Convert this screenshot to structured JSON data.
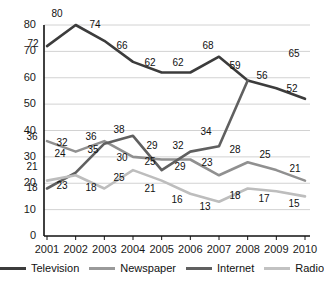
{
  "chart_data": {
    "type": "line",
    "title": "",
    "xlabel": "",
    "ylabel": "",
    "categories": [
      "2001",
      "2002",
      "2003",
      "2004",
      "2005",
      "2006",
      "2007",
      "2008",
      "2009",
      "2010"
    ],
    "ylim": [
      0,
      80
    ],
    "yticks": [
      0,
      10,
      20,
      30,
      40,
      50,
      60,
      70,
      80
    ],
    "grid": true,
    "legend_position": "bottom",
    "series": [
      {
        "name": "Television",
        "color": "#3c3c3c",
        "values": [
          72,
          80,
          74,
          66,
          62,
          62,
          68,
          59,
          56,
          52
        ],
        "labels": [
          "72",
          "80",
          "74",
          "66",
          "62",
          "62",
          "68",
          "59",
          "56",
          "52"
        ]
      },
      {
        "name": "Newspaper",
        "color": "#909090",
        "values": [
          36,
          32,
          36,
          30,
          29,
          29,
          23,
          28,
          25,
          21
        ],
        "labels": [
          "36",
          "32",
          "36",
          "30",
          "29",
          "29",
          "23",
          "28",
          "25",
          "21"
        ]
      },
      {
        "name": "Internet",
        "color": "#606060",
        "values": [
          18,
          24,
          35,
          38,
          25,
          32,
          34,
          59,
          null,
          65
        ],
        "labels": [
          "18",
          "24",
          "35",
          "38",
          "25",
          "32",
          "34",
          "",
          "",
          ""
        ]
      },
      {
        "name": "Radio",
        "color": "#bdbdbd",
        "values": [
          21,
          23,
          18,
          25,
          21,
          16,
          13,
          18,
          17,
          15
        ],
        "labels": [
          "21",
          "23",
          "18",
          "25",
          "21",
          "16",
          "13",
          "18",
          "17",
          "15"
        ]
      }
    ]
  },
  "axis": {
    "y_tick_labels": [
      "80",
      "70",
      "60",
      "50",
      "40",
      "30",
      "20",
      "10",
      "0"
    ],
    "x_tick_labels": [
      "2001",
      "2002",
      "2003",
      "2004",
      "2005",
      "2006",
      "2007",
      "2008",
      "2009",
      "2010"
    ]
  },
  "legend": {
    "items": [
      {
        "label": "Television",
        "color": "#3c3c3c"
      },
      {
        "label": "Newspaper",
        "color": "#9a9a9a"
      },
      {
        "label": "Internet",
        "color": "#606060"
      },
      {
        "label": "Radio",
        "color": "#c2c2c2"
      }
    ]
  },
  "point_labels": [
    {
      "text": "72",
      "x": 33,
      "y": 38,
      "series": "Television"
    },
    {
      "text": "80",
      "x": 57,
      "y": 8,
      "series": "Television"
    },
    {
      "text": "74",
      "x": 95,
      "y": 19,
      "series": "Television"
    },
    {
      "text": "66",
      "x": 122,
      "y": 40,
      "series": "Television"
    },
    {
      "text": "62",
      "x": 150,
      "y": 57,
      "series": "Television"
    },
    {
      "text": "62",
      "x": 178,
      "y": 57,
      "series": "Television"
    },
    {
      "text": "68",
      "x": 208,
      "y": 40,
      "series": "Television"
    },
    {
      "text": "59",
      "x": 235,
      "y": 60,
      "series": "Television"
    },
    {
      "text": "56",
      "x": 262,
      "y": 70,
      "series": "Television"
    },
    {
      "text": "52",
      "x": 292,
      "y": 83,
      "series": "Television"
    },
    {
      "text": "65",
      "x": 294,
      "y": 48,
      "series": "Internet"
    },
    {
      "text": "36",
      "x": 32,
      "y": 131,
      "series": "Newspaper"
    },
    {
      "text": "32",
      "x": 62,
      "y": 137,
      "series": "Newspaper"
    },
    {
      "text": "36",
      "x": 91,
      "y": 131,
      "series": "Newspaper"
    },
    {
      "text": "30",
      "x": 122,
      "y": 152,
      "series": "Newspaper"
    },
    {
      "text": "29",
      "x": 152,
      "y": 140,
      "series": "Newspaper"
    },
    {
      "text": "29",
      "x": 180,
      "y": 161,
      "series": "Newspaper"
    },
    {
      "text": "23",
      "x": 207,
      "y": 157,
      "series": "Newspaper"
    },
    {
      "text": "28",
      "x": 235,
      "y": 144,
      "series": "Newspaper"
    },
    {
      "text": "25",
      "x": 265,
      "y": 149,
      "series": "Newspaper"
    },
    {
      "text": "21",
      "x": 295,
      "y": 163,
      "series": "Newspaper"
    },
    {
      "text": "18",
      "x": 32,
      "y": 182,
      "series": "Internet"
    },
    {
      "text": "24",
      "x": 60,
      "y": 148,
      "series": "Internet"
    },
    {
      "text": "35",
      "x": 93,
      "y": 144,
      "series": "Internet"
    },
    {
      "text": "38",
      "x": 119,
      "y": 124,
      "series": "Internet"
    },
    {
      "text": "25",
      "x": 150,
      "y": 156,
      "series": "Internet"
    },
    {
      "text": "32",
      "x": 178,
      "y": 140,
      "series": "Internet"
    },
    {
      "text": "34",
      "x": 206,
      "y": 126,
      "series": "Internet"
    },
    {
      "text": "21",
      "x": 32,
      "y": 161,
      "series": "Radio"
    },
    {
      "text": "23",
      "x": 62,
      "y": 180,
      "series": "Radio"
    },
    {
      "text": "18",
      "x": 91,
      "y": 182,
      "series": "Radio"
    },
    {
      "text": "25",
      "x": 119,
      "y": 172,
      "series": "Radio"
    },
    {
      "text": "21",
      "x": 150,
      "y": 183,
      "series": "Radio"
    },
    {
      "text": "16",
      "x": 177,
      "y": 194,
      "series": "Radio"
    },
    {
      "text": "13",
      "x": 205,
      "y": 201,
      "series": "Radio"
    },
    {
      "text": "18",
      "x": 235,
      "y": 190,
      "series": "Radio"
    },
    {
      "text": "17",
      "x": 264,
      "y": 193,
      "series": "Radio"
    },
    {
      "text": "15",
      "x": 294,
      "y": 198,
      "series": "Radio"
    }
  ]
}
